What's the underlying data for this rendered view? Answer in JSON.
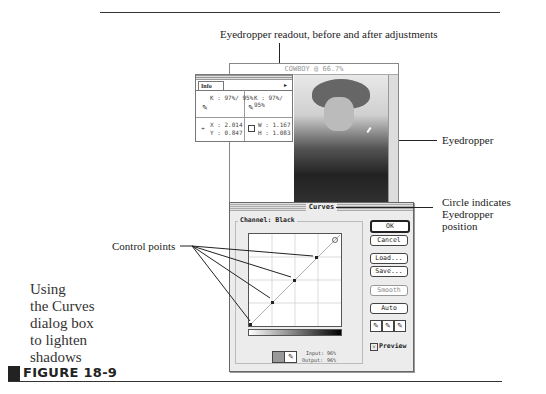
{
  "figure": {
    "number_label": "FIGURE 18-9",
    "caption_lines": [
      "Using",
      "the Curves",
      "dialog box",
      "to lighten",
      "shadows"
    ]
  },
  "callouts": {
    "top": "Eyedropper readout, before and after adjustments",
    "eyedropper": "Eyedropper",
    "circle": [
      "Circle indicates",
      "Eyedropper",
      "position"
    ],
    "control_points": "Control points"
  },
  "document_window": {
    "title": "COWBOY @ 66.7%"
  },
  "info_palette": {
    "tab": "Info",
    "k_before": "K : 97%/ 95%",
    "k_after": "K : 97%/ 95%",
    "x": "X : 2.014",
    "y": "Y : 0.847",
    "w": "W : 1.167",
    "h": "H : 1.083"
  },
  "curves_dialog": {
    "title": "Curves",
    "channel_label": "Channel: Black",
    "buttons": {
      "ok": "OK",
      "cancel": "Cancel",
      "load": "Load...",
      "save": "Save...",
      "smooth": "Smooth",
      "auto": "Auto"
    },
    "input_label": "Input:",
    "input_value": "96%",
    "output_label": "Output:",
    "output_value": "96%",
    "preview_label": "Preview",
    "preview_checked": true
  }
}
